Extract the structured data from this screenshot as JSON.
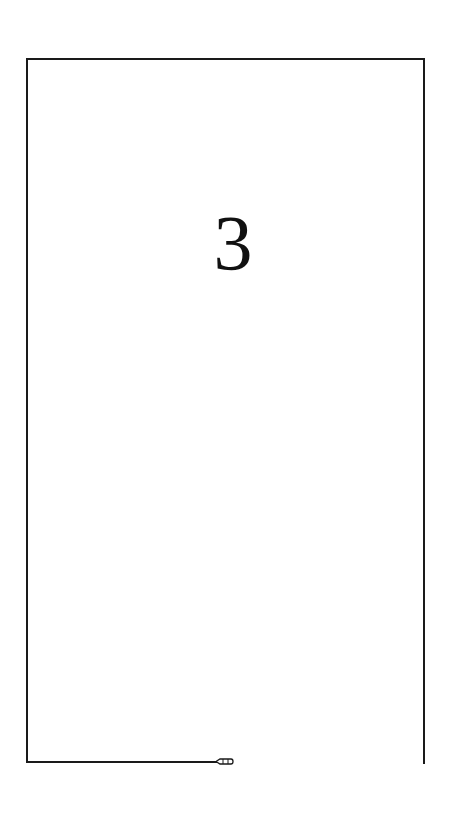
{
  "page": {
    "number": "3"
  },
  "icons": {
    "pencil": "pencil-icon"
  },
  "colors": {
    "line": "#1a1a1a",
    "text": "#111111",
    "background": "#ffffff"
  }
}
